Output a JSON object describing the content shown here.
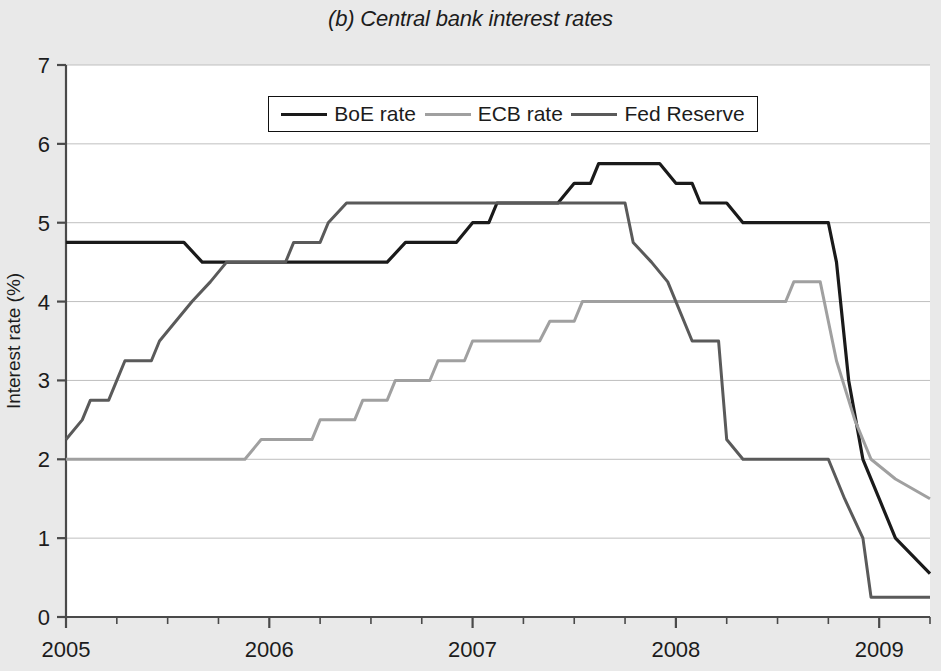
{
  "chart_data": {
    "type": "line",
    "title": "(b) Central bank interest rates",
    "xlabel": "",
    "ylabel": "Interest rate (%)",
    "xlim": [
      2005.0,
      2009.25
    ],
    "ylim": [
      0,
      7
    ],
    "yticks": [
      "0",
      "1",
      "2",
      "3",
      "4",
      "5",
      "6",
      "7"
    ],
    "ytick_values": [
      0,
      1,
      2,
      3,
      4,
      5,
      6,
      7
    ],
    "xticks": [
      "2005",
      "2006",
      "2007",
      "2008",
      "2009"
    ],
    "xtick_values": [
      2005,
      2006,
      2007,
      2008,
      2009
    ],
    "minor_xticks_per_year": 4,
    "grid": "horizontal",
    "legend_position": "top-center",
    "colors": {
      "boe": "#1a1a1a",
      "ecb": "#a0a0a0",
      "fed": "#5a5a5a",
      "background": "#e9e9e9",
      "plot_background": "#ffffff",
      "gridline": "#bfbfbf",
      "axis": "#4a4a4a"
    },
    "series": [
      {
        "name": "BoE rate",
        "color": "#1a1a1a",
        "points": [
          [
            2005.0,
            4.75
          ],
          [
            2005.58,
            4.75
          ],
          [
            2005.67,
            4.5
          ],
          [
            2006.58,
            4.5
          ],
          [
            2006.67,
            4.75
          ],
          [
            2006.92,
            4.75
          ],
          [
            2007.0,
            5.0
          ],
          [
            2007.08,
            5.0
          ],
          [
            2007.12,
            5.25
          ],
          [
            2007.42,
            5.25
          ],
          [
            2007.5,
            5.5
          ],
          [
            2007.58,
            5.5
          ],
          [
            2007.62,
            5.75
          ],
          [
            2007.92,
            5.75
          ],
          [
            2008.0,
            5.5
          ],
          [
            2008.08,
            5.5
          ],
          [
            2008.12,
            5.25
          ],
          [
            2008.25,
            5.25
          ],
          [
            2008.33,
            5.0
          ],
          [
            2008.75,
            5.0
          ],
          [
            2008.79,
            4.5
          ],
          [
            2008.85,
            3.0
          ],
          [
            2008.92,
            2.0
          ],
          [
            2009.0,
            1.5
          ],
          [
            2009.08,
            1.0
          ],
          [
            2009.25,
            0.55
          ]
        ]
      },
      {
        "name": "ECB rate",
        "color": "#a0a0a0",
        "points": [
          [
            2005.0,
            2.0
          ],
          [
            2005.88,
            2.0
          ],
          [
            2005.96,
            2.25
          ],
          [
            2006.21,
            2.25
          ],
          [
            2006.25,
            2.5
          ],
          [
            2006.42,
            2.5
          ],
          [
            2006.46,
            2.75
          ],
          [
            2006.58,
            2.75
          ],
          [
            2006.62,
            3.0
          ],
          [
            2006.79,
            3.0
          ],
          [
            2006.83,
            3.25
          ],
          [
            2006.96,
            3.25
          ],
          [
            2007.0,
            3.5
          ],
          [
            2007.33,
            3.5
          ],
          [
            2007.38,
            3.75
          ],
          [
            2007.5,
            3.75
          ],
          [
            2007.54,
            4.0
          ],
          [
            2008.54,
            4.0
          ],
          [
            2008.58,
            4.25
          ],
          [
            2008.71,
            4.25
          ],
          [
            2008.79,
            3.25
          ],
          [
            2008.88,
            2.5
          ],
          [
            2008.96,
            2.0
          ],
          [
            2009.08,
            1.75
          ],
          [
            2009.25,
            1.5
          ]
        ]
      },
      {
        "name": "Fed Reserve",
        "color": "#5a5a5a",
        "points": [
          [
            2005.0,
            2.25
          ],
          [
            2005.08,
            2.5
          ],
          [
            2005.12,
            2.75
          ],
          [
            2005.21,
            2.75
          ],
          [
            2005.25,
            3.0
          ],
          [
            2005.29,
            3.25
          ],
          [
            2005.42,
            3.25
          ],
          [
            2005.46,
            3.5
          ],
          [
            2005.54,
            3.75
          ],
          [
            2005.62,
            4.0
          ],
          [
            2005.71,
            4.25
          ],
          [
            2005.79,
            4.5
          ],
          [
            2006.08,
            4.5
          ],
          [
            2006.12,
            4.75
          ],
          [
            2006.25,
            4.75
          ],
          [
            2006.29,
            5.0
          ],
          [
            2006.38,
            5.25
          ],
          [
            2007.75,
            5.25
          ],
          [
            2007.79,
            4.75
          ],
          [
            2007.88,
            4.5
          ],
          [
            2007.96,
            4.25
          ],
          [
            2008.08,
            3.5
          ],
          [
            2008.21,
            3.5
          ],
          [
            2008.25,
            2.25
          ],
          [
            2008.33,
            2.0
          ],
          [
            2008.75,
            2.0
          ],
          [
            2008.83,
            1.5
          ],
          [
            2008.92,
            1.0
          ],
          [
            2008.96,
            0.25
          ],
          [
            2009.25,
            0.25
          ]
        ]
      }
    ]
  },
  "legend": {
    "entries": [
      {
        "label": "BoE rate",
        "color": "#1a1a1a",
        "width": 3.2
      },
      {
        "label": "ECB rate",
        "color": "#a0a0a0",
        "width": 3.0
      },
      {
        "label": "Fed Reserve",
        "color": "#5a5a5a",
        "width": 3.0
      }
    ]
  }
}
